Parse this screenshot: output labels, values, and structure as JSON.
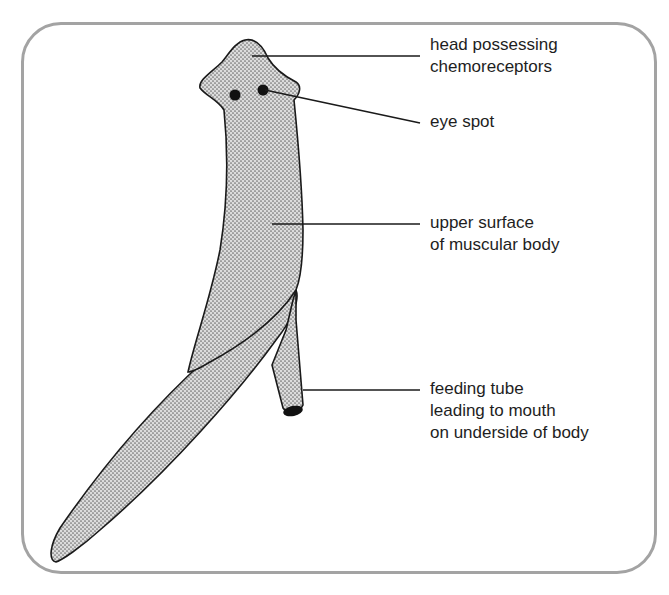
{
  "diagram": {
    "frame_color": "#a3a3a3",
    "body_fill": "#d9d9d9",
    "outline_color": "#1a1a1a",
    "labels": [
      {
        "id": "head",
        "lines": [
          "head possessing",
          "chemoreceptors"
        ]
      },
      {
        "id": "eye-spot",
        "lines": [
          "eye spot"
        ]
      },
      {
        "id": "upper-surface",
        "lines": [
          "upper surface",
          "of muscular body"
        ]
      },
      {
        "id": "feeding-tube",
        "lines": [
          "feeding tube",
          "leading to mouth",
          "on underside of body"
        ]
      }
    ]
  }
}
